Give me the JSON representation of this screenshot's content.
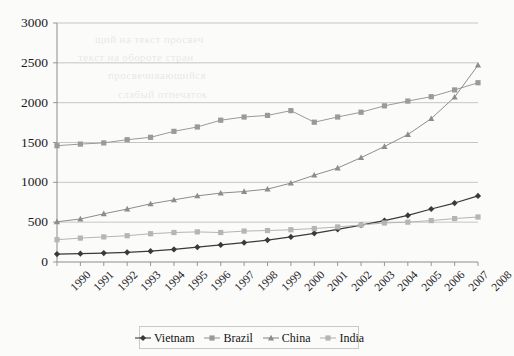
{
  "chart_data": {
    "type": "line",
    "title": "",
    "xlabel": "",
    "ylabel": "",
    "ylim": [
      0,
      3000
    ],
    "ytick_step": 500,
    "yticks": [
      "0",
      "500",
      "1000",
      "1500",
      "2000",
      "2500",
      "3000"
    ],
    "grid": true,
    "legend_position": "bottom",
    "categories": [
      "1990",
      "1991",
      "1992",
      "1993",
      "1994",
      "1995",
      "1996",
      "1997",
      "1998",
      "1999",
      "2000",
      "2001",
      "2002",
      "2003",
      "2004",
      "2005",
      "2006",
      "2007",
      "2008"
    ],
    "series": [
      {
        "name": "Vietnam",
        "color": "#3a3a3a",
        "marker": "diamond",
        "values": [
          100,
          105,
          112,
          122,
          136,
          158,
          186,
          214,
          243,
          275,
          315,
          360,
          410,
          462,
          520,
          585,
          665,
          740,
          830
        ]
      },
      {
        "name": "Brazil",
        "color": "#9a9a9a",
        "marker": "square",
        "values": [
          1460,
          1480,
          1495,
          1535,
          1565,
          1640,
          1695,
          1780,
          1820,
          1840,
          1900,
          1755,
          1820,
          1880,
          1960,
          2020,
          2075,
          2160,
          2250
        ]
      },
      {
        "name": "China",
        "color": "#8d8d8d",
        "marker": "triangle",
        "values": [
          505,
          540,
          605,
          665,
          730,
          780,
          830,
          865,
          885,
          915,
          990,
          1090,
          1180,
          1310,
          1450,
          1600,
          1800,
          2070,
          2470
        ]
      },
      {
        "name": "India",
        "color": "#b5b5b5",
        "marker": "square",
        "values": [
          280,
          300,
          315,
          330,
          355,
          370,
          378,
          370,
          388,
          395,
          405,
          420,
          440,
          465,
          490,
          500,
          520,
          545,
          565
        ]
      }
    ]
  },
  "legend": {
    "items": [
      {
        "label": "Vietnam"
      },
      {
        "label": "Brazil"
      },
      {
        "label": "China"
      },
      {
        "label": "India"
      }
    ]
  },
  "background_bleed": [
    {
      "text": "щий на текст просвеч",
      "x": 95,
      "y": 33
    },
    {
      "text": "текст на обороте стран",
      "x": 78,
      "y": 51
    },
    {
      "text": "просвечивающийся",
      "x": 108,
      "y": 69
    },
    {
      "text": "слабый отпечаток",
      "x": 118,
      "y": 88
    }
  ]
}
